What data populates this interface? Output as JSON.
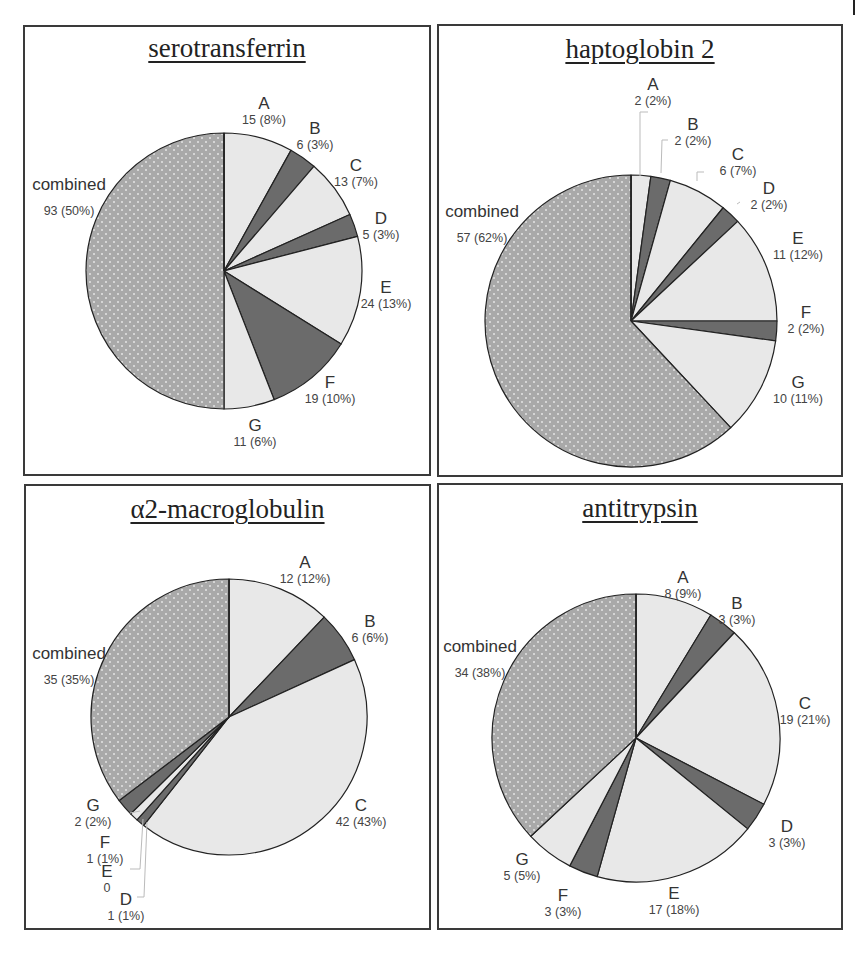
{
  "figure": {
    "colors": {
      "combined_fill": "#a9a9a9",
      "combined_dot": "#e4e4e4",
      "dark_fill": "#6b6b6b",
      "light_fill": "#e8e8e8",
      "stroke": "#222222",
      "frame": "#3a3a3a"
    }
  },
  "chart_data": [
    {
      "type": "pie",
      "title": "serotransferrin",
      "start": "12 o'clock, clockwise",
      "slices": [
        {
          "label": "A",
          "value": 15,
          "percent": 8,
          "text": "15 (8%)",
          "shade": "light"
        },
        {
          "label": "B",
          "value": 6,
          "percent": 3,
          "text": "6 (3%)",
          "shade": "dark"
        },
        {
          "label": "C",
          "value": 13,
          "percent": 7,
          "text": "13 (7%)",
          "shade": "light"
        },
        {
          "label": "D",
          "value": 5,
          "percent": 3,
          "text": "5 (3%)",
          "shade": "dark"
        },
        {
          "label": "E",
          "value": 24,
          "percent": 13,
          "text": "24 (13%)",
          "shade": "light"
        },
        {
          "label": "F",
          "value": 19,
          "percent": 10,
          "text": "19 (10%)",
          "shade": "dark"
        },
        {
          "label": "G",
          "value": 11,
          "percent": 6,
          "text": "11 (6%)",
          "shade": "light"
        },
        {
          "label": "combined",
          "value": 93,
          "percent": 50,
          "text": "93 (50%)",
          "shade": "combined"
        }
      ]
    },
    {
      "type": "pie",
      "title": "haptoglobin 2",
      "start": "12 o'clock, clockwise",
      "slices": [
        {
          "label": "A",
          "value": 2,
          "percent": 2,
          "text": "2 (2%)",
          "shade": "light"
        },
        {
          "label": "B",
          "value": 2,
          "percent": 2,
          "text": "2 (2%)",
          "shade": "dark"
        },
        {
          "label": "C",
          "value": 6,
          "percent": 7,
          "text": "6 (7%)",
          "shade": "light"
        },
        {
          "label": "D",
          "value": 2,
          "percent": 2,
          "text": "2 (2%)",
          "shade": "dark"
        },
        {
          "label": "E",
          "value": 11,
          "percent": 12,
          "text": "11 (12%)",
          "shade": "light"
        },
        {
          "label": "F",
          "value": 2,
          "percent": 2,
          "text": "2 (2%)",
          "shade": "dark"
        },
        {
          "label": "G",
          "value": 10,
          "percent": 11,
          "text": "10 (11%)",
          "shade": "light"
        },
        {
          "label": "combined",
          "value": 57,
          "percent": 62,
          "text": "57 (62%)",
          "shade": "combined"
        }
      ]
    },
    {
      "type": "pie",
      "title": "α2-macroglobulin",
      "start": "12 o'clock, clockwise",
      "slices": [
        {
          "label": "A",
          "value": 12,
          "percent": 12,
          "text": "12 (12%)",
          "shade": "light"
        },
        {
          "label": "B",
          "value": 6,
          "percent": 6,
          "text": "6 (6%)",
          "shade": "dark"
        },
        {
          "label": "C",
          "value": 42,
          "percent": 43,
          "text": "42 (43%)",
          "shade": "light"
        },
        {
          "label": "D",
          "value": 1,
          "percent": 1,
          "text": "1 (1%)",
          "shade": "dark"
        },
        {
          "label": "E",
          "value": 0,
          "percent": 0,
          "text": "0",
          "shade": "light"
        },
        {
          "label": "F",
          "value": 1,
          "percent": 1,
          "text": "1 (1%)",
          "shade": "light"
        },
        {
          "label": "G",
          "value": 2,
          "percent": 2,
          "text": "2 (2%)",
          "shade": "dark"
        },
        {
          "label": "combined",
          "value": 35,
          "percent": 35,
          "text": "35 (35%)",
          "shade": "combined"
        }
      ]
    },
    {
      "type": "pie",
      "title": "antitrypsin",
      "start": "12 o'clock, clockwise",
      "slices": [
        {
          "label": "A",
          "value": 8,
          "percent": 9,
          "text": "8 (9%)",
          "shade": "light"
        },
        {
          "label": "B",
          "value": 3,
          "percent": 3,
          "text": "3 (3%)",
          "shade": "dark"
        },
        {
          "label": "C",
          "value": 19,
          "percent": 21,
          "text": "19 (21%)",
          "shade": "light"
        },
        {
          "label": "D",
          "value": 3,
          "percent": 3,
          "text": "3 (3%)",
          "shade": "dark"
        },
        {
          "label": "E",
          "value": 17,
          "percent": 18,
          "text": "17 (18%)",
          "shade": "light"
        },
        {
          "label": "F",
          "value": 3,
          "percent": 3,
          "text": "3 (3%)",
          "shade": "dark"
        },
        {
          "label": "G",
          "value": 5,
          "percent": 5,
          "text": "5 (5%)",
          "shade": "light"
        },
        {
          "label": "combined",
          "value": 34,
          "percent": 38,
          "text": "34 (38%)",
          "shade": "combined"
        }
      ]
    }
  ]
}
